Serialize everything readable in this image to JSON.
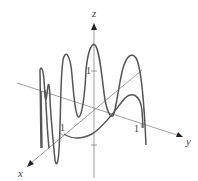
{
  "diagram": {
    "type": "3d-space-curve",
    "axes": {
      "x_label": "x",
      "y_label": "y",
      "z_label": "z"
    },
    "tick_labels": {
      "x_tick": "1",
      "y_tick": "1",
      "z_tick": "1"
    },
    "colors": {
      "curve": "#555555",
      "axis": "#666666",
      "text": "#444444"
    }
  }
}
